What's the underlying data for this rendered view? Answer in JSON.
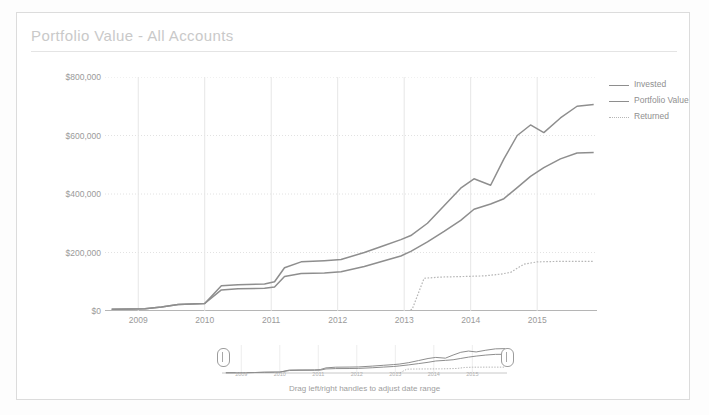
{
  "card": {
    "title": "Portfolio Value - All Accounts"
  },
  "legend": {
    "position": "right",
    "items": [
      {
        "label": "Invested",
        "style": "solid",
        "color": "#8e8e8e"
      },
      {
        "label": "Portfolio Value",
        "style": "solid",
        "color": "#8e8e8e"
      },
      {
        "label": "Returned",
        "style": "dotted",
        "color": "#b6b6b6"
      }
    ]
  },
  "range_selector": {
    "hint": "Drag left/right handles to adjust date range",
    "tick_labels": [
      "2009",
      "2010",
      "2011",
      "2012",
      "2013",
      "2014",
      "2015"
    ],
    "left_handle_label": "left-handle",
    "right_handle_label": "right-handle"
  },
  "chart_data": {
    "type": "line",
    "title": "Portfolio Value - All Accounts",
    "xlabel": "",
    "ylabel": "",
    "grid": true,
    "xlim": [
      2008.5,
      2015.9
    ],
    "ylim": [
      0,
      800000
    ],
    "x_tick_labels": [
      "2009",
      "2010",
      "2011",
      "2012",
      "2013",
      "2014",
      "2015"
    ],
    "x_ticks": [
      2009,
      2010,
      2011,
      2012,
      2013,
      2014,
      2015
    ],
    "y_tick_labels": [
      "$0",
      "$200,000",
      "$400,000",
      "$600,000",
      "$800,000"
    ],
    "y_ticks": [
      0,
      200000,
      400000,
      600000,
      800000
    ],
    "series": [
      {
        "name": "Portfolio Value",
        "style": "solid",
        "color": "#8e8e8e",
        "x": [
          2008.6,
          2008.9,
          2009.1,
          2009.35,
          2009.6,
          2009.8,
          2010.0,
          2010.25,
          2010.5,
          2010.9,
          2011.05,
          2011.2,
          2011.45,
          2011.8,
          2012.05,
          2012.4,
          2012.7,
          2012.95,
          2013.1,
          2013.35,
          2013.6,
          2013.85,
          2014.05,
          2014.3,
          2014.5,
          2014.7,
          2014.9,
          2015.1,
          2015.35,
          2015.6,
          2015.85
        ],
        "y": [
          6000,
          7000,
          8000,
          14000,
          22000,
          24000,
          26000,
          86000,
          90000,
          92000,
          100000,
          148000,
          168000,
          172000,
          176000,
          200000,
          224000,
          244000,
          258000,
          300000,
          360000,
          420000,
          452000,
          430000,
          520000,
          600000,
          636000,
          610000,
          660000,
          700000,
          706000
        ]
      },
      {
        "name": "Invested",
        "style": "solid",
        "color": "#8e8e8e",
        "x": [
          2008.6,
          2008.9,
          2009.1,
          2009.35,
          2009.6,
          2009.8,
          2010.0,
          2010.25,
          2010.5,
          2010.9,
          2011.05,
          2011.2,
          2011.45,
          2011.8,
          2012.05,
          2012.4,
          2012.7,
          2012.95,
          2013.1,
          2013.35,
          2013.6,
          2013.85,
          2014.05,
          2014.3,
          2014.5,
          2014.7,
          2014.9,
          2015.1,
          2015.35,
          2015.6,
          2015.85
        ],
        "y": [
          6000,
          7000,
          8000,
          14000,
          22000,
          24000,
          26000,
          72000,
          76000,
          78000,
          82000,
          118000,
          128000,
          130000,
          134000,
          152000,
          172000,
          188000,
          204000,
          236000,
          272000,
          310000,
          348000,
          366000,
          384000,
          422000,
          460000,
          490000,
          520000,
          540000,
          542000
        ]
      },
      {
        "name": "Returned",
        "style": "dotted",
        "color": "#b6b6b6",
        "x": [
          2013.05,
          2013.12,
          2013.3,
          2013.55,
          2013.9,
          2014.2,
          2014.45,
          2014.6,
          2014.8,
          2015.0,
          2015.4,
          2015.85
        ],
        "y": [
          0,
          6000,
          112000,
          116000,
          118000,
          120000,
          126000,
          132000,
          160000,
          168000,
          170000,
          170000
        ]
      }
    ]
  },
  "range_chart_data": {
    "type": "line",
    "xlim": [
      2008.5,
      2015.9
    ],
    "ylim": [
      0,
      800000
    ],
    "series": [
      {
        "name": "Portfolio Value",
        "style": "solid"
      },
      {
        "name": "Invested",
        "style": "solid"
      },
      {
        "name": "Returned",
        "style": "dotted"
      }
    ]
  }
}
